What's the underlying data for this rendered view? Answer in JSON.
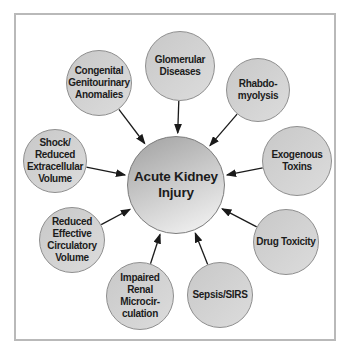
{
  "diagram": {
    "type": "hub-and-spoke",
    "center": {
      "label": "Acute Kidney\nInjury"
    },
    "nodes": [
      {
        "id": "glomerular-diseases",
        "label": "Glomerular\nDiseases"
      },
      {
        "id": "rhabdomyolysis",
        "label": "Rhabdo-\nmyolysis"
      },
      {
        "id": "exogenous-toxins",
        "label": "Exogenous\nToxins"
      },
      {
        "id": "drug-toxicity",
        "label": "Drug Toxicity"
      },
      {
        "id": "sepsis-sirs",
        "label": "Sepsis/SIRS"
      },
      {
        "id": "impaired-renal-microcirculation",
        "label": "Impaired\nRenal\nMicrocir-\nculation"
      },
      {
        "id": "reduced-effective-circulatory-volume",
        "label": "Reduced\nEffective\nCirculatory\nVolume"
      },
      {
        "id": "shock-reduced-extracellular-volume",
        "label": "Shock/\nReduced\nExtracellular\nVolume"
      },
      {
        "id": "congenital-genitourinary-anomalies",
        "label": "Congenital\nGenitourinary\nAnomalies"
      }
    ],
    "colors": {
      "background": "#ffffff",
      "frame_border": "#b9b9b9",
      "node_fill": "#d2d2d2",
      "node_border": "#8e8e8e",
      "center_gradient_start": "#a4a4a4",
      "center_gradient_end": "#f0f0f0",
      "center_border": "#7c7c7c",
      "arrow": "#1a1a1a",
      "text": "#1c1c1c"
    }
  }
}
